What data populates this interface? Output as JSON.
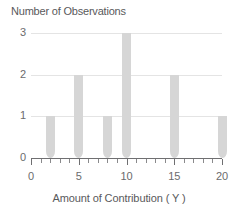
{
  "chart_data": {
    "type": "bar",
    "title": "",
    "ylabel": "Number of Observations",
    "xlabel": "Amount of Contribution ( Y )",
    "x": [
      2,
      5,
      8,
      10,
      15,
      20
    ],
    "values": [
      1,
      2,
      1,
      3,
      2,
      1
    ],
    "categories": [
      "2",
      "5",
      "8",
      "10",
      "15",
      "20"
    ],
    "xlim": [
      0,
      20
    ],
    "ylim": [
      0,
      3
    ],
    "x_tick_labels": [
      "0",
      "5",
      "10",
      "15",
      "20"
    ],
    "x_tick_values": [
      0,
      5,
      10,
      15,
      20
    ],
    "x_minor_tick_step": 1,
    "y_tick_labels": [
      "0",
      "1",
      "2",
      "3"
    ],
    "y_tick_values": [
      0,
      1,
      2,
      3
    ],
    "gridlines": [
      1,
      2,
      3
    ],
    "grid": true,
    "legend": null,
    "bar_color": "#d6d6d6",
    "gridline_color": "#e4e4e4",
    "axis_color": "#6f6f71",
    "text_color": "#59595b"
  },
  "labels": {
    "y_axis_title": "Number of Observations",
    "x_axis_title": "Amount of Contribution ( Y )"
  }
}
